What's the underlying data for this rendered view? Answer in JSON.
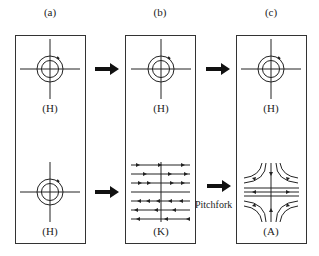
{
  "columns": [
    {
      "id": "a",
      "header": "(a)",
      "top_label": "(H)",
      "bottom_label": "(H)"
    },
    {
      "id": "b",
      "header": "(b)",
      "top_label": "(H)",
      "bottom_label": "(K)"
    },
    {
      "id": "c",
      "header": "(c)",
      "top_label": "(H)",
      "bottom_label": "(A)"
    }
  ],
  "transitions": {
    "bifurcation_label": "Pitchfork"
  },
  "colors": {
    "stroke": "#222222",
    "background": "#ffffff"
  }
}
